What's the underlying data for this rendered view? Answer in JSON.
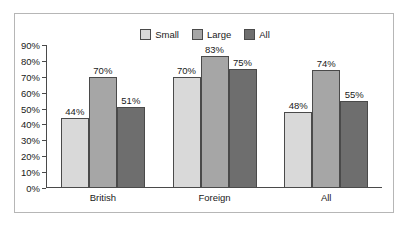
{
  "chart_data": {
    "type": "bar",
    "title": "",
    "subtitle": "",
    "xlabel": "",
    "ylabel": "",
    "categories": [
      "British",
      "Foreign",
      "All"
    ],
    "series": [
      {
        "name": "Small",
        "values": [
          44,
          70,
          48
        ],
        "labels": [
          "44%",
          "70%",
          "48%"
        ],
        "color": "#d9d9d9"
      },
      {
        "name": "Large",
        "values": [
          70,
          83,
          74
        ],
        "labels": [
          "70%",
          "83%",
          "74%"
        ],
        "color": "#a6a6a6"
      },
      {
        "name": "All",
        "values": [
          51,
          75,
          55
        ],
        "labels": [
          "51%",
          "75%",
          "55%"
        ],
        "color": "#6e6e6e"
      }
    ],
    "ylim": [
      0,
      90
    ],
    "ytick_values": [
      0,
      10,
      20,
      30,
      40,
      50,
      60,
      70,
      80,
      90
    ],
    "ytick_labels": [
      "0%",
      "10%",
      "20%",
      "30%",
      "40%",
      "50%",
      "60%",
      "70%",
      "80%",
      "90%"
    ],
    "grid": false,
    "legend_position": "top-center",
    "value_labels_shown": true,
    "axis_color": "#4a4a4a",
    "frame_color": "#b6b6b6",
    "text_color": "#1a1a1a",
    "background": "#ffffff"
  },
  "legend": {
    "entries": [
      {
        "label": "Small",
        "color": "#d9d9d9"
      },
      {
        "label": "Large",
        "color": "#a6a6a6"
      },
      {
        "label": "All",
        "color": "#6e6e6e"
      }
    ]
  }
}
